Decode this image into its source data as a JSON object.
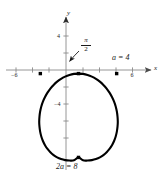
{
  "figure": {
    "type": "polar-curve-plot",
    "background_color": "#ffffff",
    "curve_color": "#000000",
    "axis_color": "#7a7a7a",
    "text_color": "#1a1a1a"
  },
  "axes": {
    "x_axis_label": "x",
    "y_axis_label": "y",
    "x_ticks": [
      {
        "value": -6,
        "label": "−6"
      },
      {
        "value": -4,
        "label": ""
      },
      {
        "value": -2,
        "label": ""
      },
      {
        "value": 2,
        "label": ""
      },
      {
        "value": 4,
        "label": ""
      },
      {
        "value": 6,
        "label": "6"
      }
    ],
    "y_ticks": [
      {
        "value": 4,
        "label": "4"
      },
      {
        "value": 2,
        "label": ""
      },
      {
        "value": -2,
        "label": ""
      },
      {
        "value": -4,
        "label": "−4"
      },
      {
        "value": -6,
        "label": ""
      },
      {
        "value": -8,
        "label": ""
      }
    ],
    "xlim": [
      -7.6,
      7.6
    ],
    "ylim": [
      -9.2,
      5.4
    ]
  },
  "annotations": {
    "angle_numerator": "π",
    "angle_denominator": "2",
    "right_point": "a = 4",
    "bottom_point": "2a = 8"
  },
  "chart_data": {
    "type": "line",
    "title": "",
    "xlabel": "x",
    "ylabel": "y",
    "xlim": [
      -7.6,
      7.6
    ],
    "ylim": [
      -9.2,
      5.4
    ],
    "grid": false,
    "legend": null,
    "curve_name": "cardioid r = a(1 - sin θ), a = 4",
    "parameter_a": 4,
    "markers": [
      {
        "name": "left-intercept",
        "x": -4,
        "y": 0
      },
      {
        "name": "cusp",
        "x": 0,
        "y": 0
      },
      {
        "name": "right-intercept",
        "x": 4,
        "y": 0
      },
      {
        "name": "bottom-point",
        "x": 0,
        "y": -8
      }
    ],
    "series": [
      {
        "name": "cardioid",
        "points": [
          [
            0.0,
            0.0
          ],
          [
            -0.48,
            -0.03
          ],
          [
            -0.95,
            -0.13
          ],
          [
            -1.4,
            -0.29
          ],
          [
            -1.83,
            -0.5
          ],
          [
            -2.24,
            -0.77
          ],
          [
            -2.61,
            -1.08
          ],
          [
            -2.95,
            -1.43
          ],
          [
            -3.25,
            -1.82
          ],
          [
            -3.51,
            -2.24
          ],
          [
            -3.73,
            -2.68
          ],
          [
            -3.9,
            -3.14
          ],
          [
            -4.02,
            -3.62
          ],
          [
            -4.09,
            -4.1
          ],
          [
            -4.12,
            -4.59
          ],
          [
            -4.09,
            -5.07
          ],
          [
            -4.02,
            -5.54
          ],
          [
            -3.9,
            -6.0
          ],
          [
            -3.73,
            -6.43
          ],
          [
            -3.51,
            -6.83
          ],
          [
            -3.25,
            -7.19
          ],
          [
            -2.95,
            -7.51
          ],
          [
            -2.61,
            -7.78
          ],
          [
            -2.24,
            -8.0
          ],
          [
            -1.83,
            -8.16
          ],
          [
            -1.4,
            -8.26
          ],
          [
            -0.95,
            -8.3
          ],
          [
            -0.48,
            -8.28
          ],
          [
            0.0,
            -8.0
          ],
          [
            0.48,
            -8.28
          ],
          [
            0.95,
            -8.3
          ],
          [
            1.4,
            -8.26
          ],
          [
            1.83,
            -8.16
          ],
          [
            2.24,
            -8.0
          ],
          [
            2.61,
            -7.78
          ],
          [
            2.95,
            -7.51
          ],
          [
            3.25,
            -7.19
          ],
          [
            3.51,
            -6.83
          ],
          [
            3.73,
            -6.43
          ],
          [
            3.9,
            -6.0
          ],
          [
            4.02,
            -5.54
          ],
          [
            4.09,
            -5.07
          ],
          [
            4.12,
            -4.59
          ],
          [
            4.09,
            -4.1
          ],
          [
            4.02,
            -3.62
          ],
          [
            3.9,
            -3.14
          ],
          [
            3.73,
            -2.68
          ],
          [
            3.51,
            -2.24
          ],
          [
            3.25,
            -1.82
          ],
          [
            2.95,
            -1.43
          ],
          [
            2.61,
            -1.08
          ],
          [
            2.24,
            -0.77
          ],
          [
            1.83,
            -0.5
          ],
          [
            1.4,
            -0.29
          ],
          [
            0.95,
            -0.13
          ],
          [
            0.48,
            -0.03
          ],
          [
            0.0,
            0.0
          ]
        ]
      }
    ]
  }
}
